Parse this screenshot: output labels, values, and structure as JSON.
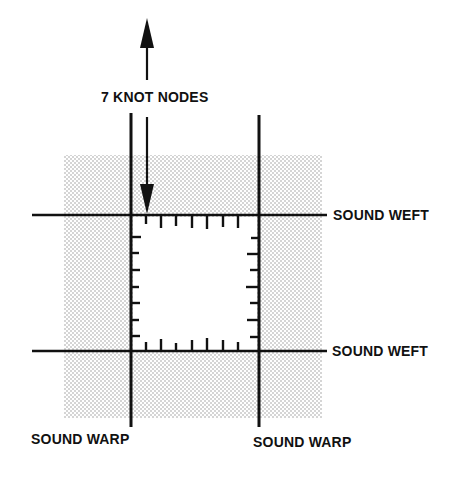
{
  "diagram": {
    "top_label": "7 KNOT NODES",
    "weft_top_label": "SOUND WEFT",
    "weft_bottom_label": "SOUND WEFT",
    "warp_left_label": "SOUND WARP",
    "warp_right_label": "SOUND WARP",
    "knot_nodes_per_side": 7,
    "colors": {
      "ink": "#111111",
      "stipple": "#9a9a9a",
      "background": "#ffffff"
    }
  }
}
